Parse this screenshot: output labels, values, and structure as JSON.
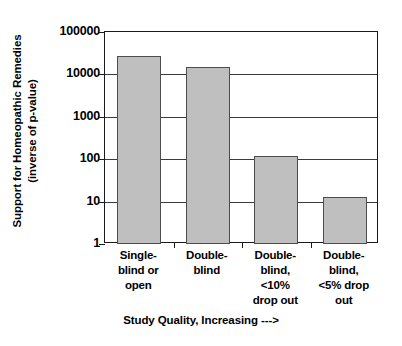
{
  "chart_data": {
    "type": "bar",
    "title": "",
    "xlabel": "Study Quality, Increasing --->",
    "ylabel_line1": "Support for Homeopathic Remedies",
    "ylabel_line2": "(inverse of p-value)",
    "categories": [
      "Single-blind or open",
      "Double-blind",
      "Double-blind, <10% drop out",
      "Double-blind, <5% drop out"
    ],
    "category_lines": [
      [
        "Single-",
        "blind or",
        "open"
      ],
      [
        "Double-",
        "blind"
      ],
      [
        "Double-",
        "blind,",
        "<10%",
        "drop out"
      ],
      [
        "Double-",
        "blind,",
        "<5% drop",
        "out"
      ]
    ],
    "values": [
      27000,
      15000,
      120,
      13
    ],
    "yscale": "log",
    "ylim": [
      1,
      100000
    ],
    "ytick_labels": [
      "100000",
      "10000",
      "1000",
      "100",
      "10",
      "1"
    ],
    "ytick_values": [
      100000,
      10000,
      1000,
      100,
      10,
      1
    ],
    "grid": true,
    "legend": "none",
    "bar_fill_color": "#BFBFBF",
    "bar_border_color": "#4D4D4D",
    "axis_color": "#1A1A1A",
    "grid_color": "#3A3A3A",
    "background_color": "#FFFFFF"
  }
}
